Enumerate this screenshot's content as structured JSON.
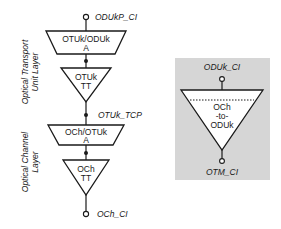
{
  "left_stack": {
    "top_point_label": "ODUkP_CI",
    "adaptation_1": {
      "line1": "OTUk/ODUk",
      "line2": "A"
    },
    "termination_1": {
      "line1": "OTUk",
      "line2": "TT"
    },
    "middle_point_label": "OTUk_TCP",
    "adaptation_2": {
      "line1": "OCh/OTUk",
      "line2": "A"
    },
    "termination_2": {
      "line1": "OCh",
      "line2": "TT"
    },
    "bottom_point_label": "OCh_CI",
    "layer_1": {
      "line1": "Optical Transport",
      "line2": "Unit Layer"
    },
    "layer_2": {
      "line1": "Optical Channel",
      "line2": "Layer"
    }
  },
  "right_panel": {
    "top_point_label": "ODUk_CI",
    "function": {
      "line1": "OCh",
      "line2": "-to-",
      "line3": "ODUk"
    },
    "bottom_point_label": "OTM_CI",
    "background_color": "#d6d6d6"
  }
}
